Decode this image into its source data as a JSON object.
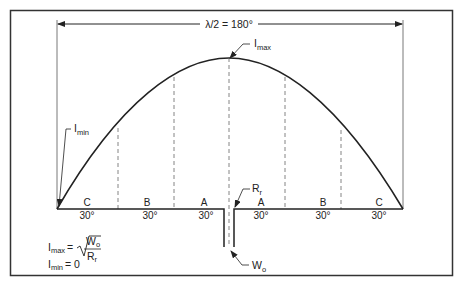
{
  "diagram": {
    "title_span": {
      "text": "λ/2 = 180°"
    },
    "labels": {
      "imax": {
        "main": "I",
        "sub": "max"
      },
      "imin": {
        "main": "I",
        "sub": "min"
      },
      "rr": {
        "main": "R",
        "sub": "r"
      },
      "wo": {
        "main": "W",
        "sub": "o"
      }
    },
    "segments": [
      {
        "letter": "C",
        "angle": "30°"
      },
      {
        "letter": "B",
        "angle": "30°"
      },
      {
        "letter": "A",
        "angle": "30°"
      },
      {
        "letter": "A",
        "angle": "30°"
      },
      {
        "letter": "B",
        "angle": "30°"
      },
      {
        "letter": "C",
        "angle": "30°"
      }
    ],
    "formula": {
      "line1_lhs_main": "I",
      "line1_lhs_sub": "max",
      "line1_eq": "=",
      "numerator_main": "W",
      "numerator_sub": "o",
      "denominator_main": "R",
      "denominator_sub": "r",
      "line2_main": "I",
      "line2_sub": "min",
      "line2_rest": "= 0"
    },
    "colors": {
      "line": "#222222",
      "dashed": "#666666",
      "frame": "#333333"
    }
  }
}
